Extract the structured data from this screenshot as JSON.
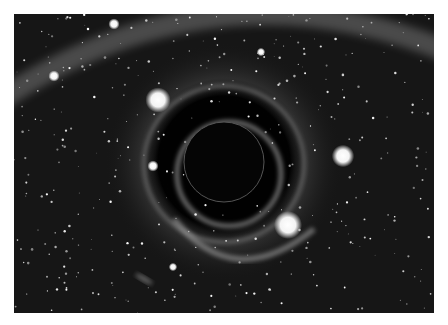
{
  "image": {
    "subject": "simulated black hole with gravitational lensing in a star field",
    "palette": {
      "background": "#141414",
      "border": "#ffffff",
      "glow": "#bdbdbd",
      "hole": "#050505"
    },
    "black_hole": {
      "cx": 210,
      "cy": 148,
      "r": 40
    },
    "bright_stars": [
      {
        "cx": 144,
        "cy": 86,
        "r": 9
      },
      {
        "cx": 329,
        "cy": 142,
        "r": 8
      },
      {
        "cx": 274,
        "cy": 211,
        "r": 10
      },
      {
        "cx": 40,
        "cy": 62,
        "r": 4
      },
      {
        "cx": 100,
        "cy": 10,
        "r": 4
      },
      {
        "cx": 139,
        "cy": 152,
        "r": 4
      },
      {
        "cx": 247,
        "cy": 38,
        "r": 3
      },
      {
        "cx": 159,
        "cy": 253,
        "r": 3
      }
    ]
  }
}
